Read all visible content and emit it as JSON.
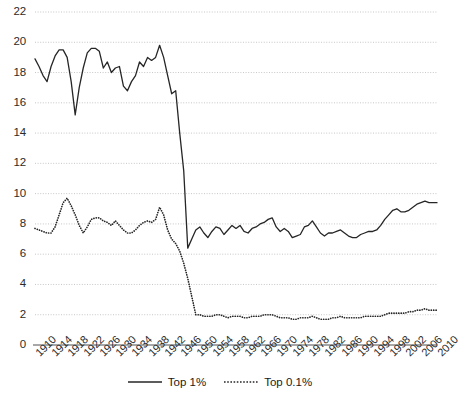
{
  "chart_data": {
    "type": "line",
    "title": "",
    "subtitle": "",
    "xlabel": "",
    "ylabel": "",
    "xlim": [
      1910,
      2010
    ],
    "ylim": [
      0,
      22
    ],
    "grid": true,
    "legend_position": "bottom-center",
    "y_ticks": [
      0,
      2,
      4,
      6,
      8,
      10,
      12,
      14,
      16,
      18,
      20,
      22
    ],
    "x_ticks": [
      1910,
      1914,
      1918,
      1922,
      1926,
      1930,
      1934,
      1938,
      1942,
      1946,
      1950,
      1954,
      1958,
      1962,
      1966,
      1970,
      1974,
      1978,
      1982,
      1986,
      1990,
      1994,
      1998,
      2002,
      2006,
      2010
    ],
    "x": [
      1910,
      1911,
      1912,
      1913,
      1914,
      1915,
      1916,
      1917,
      1918,
      1919,
      1920,
      1921,
      1922,
      1923,
      1924,
      1925,
      1926,
      1927,
      1928,
      1929,
      1930,
      1931,
      1932,
      1933,
      1934,
      1935,
      1936,
      1937,
      1938,
      1939,
      1940,
      1941,
      1942,
      1943,
      1944,
      1945,
      1946,
      1947,
      1948,
      1949,
      1950,
      1951,
      1952,
      1953,
      1954,
      1955,
      1956,
      1957,
      1958,
      1959,
      1960,
      1961,
      1962,
      1963,
      1964,
      1965,
      1966,
      1967,
      1968,
      1969,
      1970,
      1971,
      1972,
      1973,
      1974,
      1975,
      1976,
      1977,
      1978,
      1979,
      1980,
      1981,
      1982,
      1983,
      1984,
      1985,
      1986,
      1987,
      1988,
      1989,
      1990,
      1991,
      1992,
      1993,
      1994,
      1995,
      1996,
      1997,
      1998,
      1999,
      2000,
      2001,
      2002,
      2003,
      2004,
      2005,
      2006,
      2007,
      2008,
      2009,
      2010
    ],
    "series": [
      {
        "name": "Top 1%",
        "style": "solid",
        "color": "#262626",
        "values": [
          18.9,
          18.4,
          17.8,
          17.4,
          18.4,
          19.1,
          19.5,
          19.5,
          19.0,
          17.4,
          15.2,
          17.0,
          18.3,
          19.3,
          19.6,
          19.6,
          19.4,
          18.3,
          18.7,
          18.0,
          18.3,
          18.4,
          17.1,
          16.8,
          17.4,
          17.8,
          18.7,
          18.4,
          19.0,
          18.8,
          19.0,
          19.8,
          19.0,
          17.8,
          16.6,
          16.8,
          14.0,
          11.5,
          6.4,
          7.0,
          7.6,
          7.8,
          7.4,
          7.1,
          7.5,
          7.8,
          7.7,
          7.3,
          7.6,
          7.9,
          7.7,
          7.9,
          7.5,
          7.4,
          7.7,
          7.8,
          8.0,
          8.1,
          8.3,
          8.4,
          7.8,
          7.5,
          7.7,
          7.5,
          7.1,
          7.2,
          7.3,
          7.8,
          7.9,
          8.2,
          7.8,
          7.4,
          7.2,
          7.4,
          7.4,
          7.5,
          7.6,
          7.4,
          7.2,
          7.1,
          7.1,
          7.3,
          7.4,
          7.5,
          7.5,
          7.6,
          7.9,
          8.3,
          8.6,
          8.9,
          9.0,
          8.8,
          8.8,
          8.9,
          9.1,
          9.3,
          9.4,
          9.5,
          9.4,
          9.4,
          9.4
        ]
      },
      {
        "name": "Top 0.1%",
        "style": "dotted",
        "color": "#262626",
        "values": [
          7.7,
          7.6,
          7.5,
          7.4,
          7.4,
          7.8,
          8.6,
          9.4,
          9.7,
          9.2,
          8.6,
          7.9,
          7.4,
          7.8,
          8.3,
          8.4,
          8.4,
          8.2,
          8.1,
          7.9,
          8.2,
          7.9,
          7.6,
          7.4,
          7.4,
          7.6,
          7.9,
          8.1,
          8.2,
          8.1,
          8.3,
          9.1,
          8.6,
          7.6,
          7.0,
          6.7,
          6.2,
          5.4,
          4.4,
          3.2,
          2.0,
          2.0,
          1.9,
          1.9,
          1.9,
          2.0,
          2.0,
          1.9,
          1.8,
          1.9,
          1.9,
          1.9,
          1.8,
          1.8,
          1.9,
          1.9,
          1.9,
          2.0,
          2.0,
          2.0,
          1.9,
          1.8,
          1.8,
          1.8,
          1.7,
          1.7,
          1.8,
          1.8,
          1.8,
          1.9,
          1.8,
          1.7,
          1.7,
          1.7,
          1.8,
          1.8,
          1.9,
          1.8,
          1.8,
          1.8,
          1.8,
          1.8,
          1.9,
          1.9,
          1.9,
          1.9,
          1.9,
          2.0,
          2.1,
          2.1,
          2.1,
          2.1,
          2.1,
          2.2,
          2.2,
          2.3,
          2.3,
          2.4,
          2.3,
          2.3,
          2.3
        ]
      }
    ]
  },
  "legend": {
    "items": [
      {
        "label": "Top 1%"
      },
      {
        "label": "Top 0.1%"
      }
    ]
  }
}
